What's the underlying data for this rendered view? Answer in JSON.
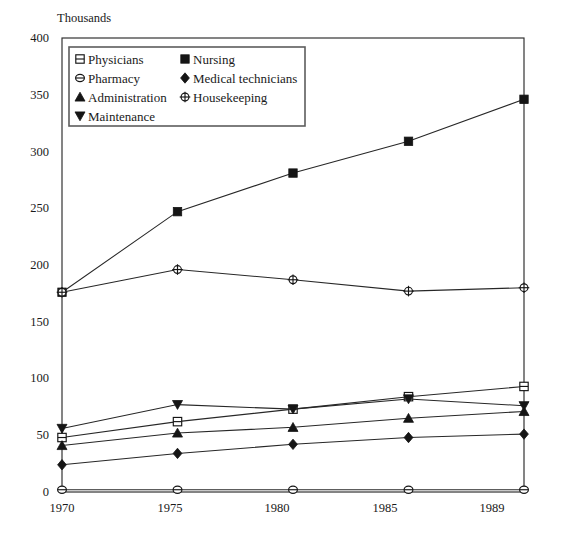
{
  "chart_data": {
    "type": "line",
    "title": "",
    "subtitle": "",
    "unit_label": "Thousands",
    "xlabel": "",
    "ylabel": "",
    "x": [
      "1970",
      "1975",
      "1980",
      "1985",
      "1989"
    ],
    "categories": [
      "1970",
      "1975",
      "1980",
      "1985",
      "1989"
    ],
    "xlim": [
      0,
      4
    ],
    "ylim": [
      0,
      400
    ],
    "y_ticks": [
      0,
      50,
      100,
      150,
      200,
      250,
      300,
      350,
      400
    ],
    "y_tick_labels": [
      "0",
      "50",
      "100",
      "150",
      "200",
      "250",
      "300",
      "350",
      "400"
    ],
    "grid": false,
    "legend_position": "top-left-inside",
    "series": [
      {
        "name": "Physicians",
        "marker": "square-open-bar",
        "values": [
          48,
          62,
          73,
          84,
          93
        ]
      },
      {
        "name": "Nursing",
        "marker": "square-filled",
        "values": [
          176,
          247,
          281,
          309,
          346
        ]
      },
      {
        "name": "Pharmacy",
        "marker": "circle-open-bar",
        "values": [
          2,
          2,
          2,
          2,
          2
        ]
      },
      {
        "name": "Medical technicians",
        "marker": "diamond-filled",
        "values": [
          24,
          34,
          42,
          48,
          51
        ]
      },
      {
        "name": "Administration",
        "marker": "triangle-up",
        "values": [
          41,
          52,
          57,
          65,
          71
        ]
      },
      {
        "name": "Housekeeping",
        "marker": "circle-open-cross",
        "values": [
          176,
          196,
          187,
          177,
          180
        ]
      },
      {
        "name": "Maintenance",
        "marker": "triangle-down",
        "values": [
          56,
          77,
          73,
          82,
          76
        ]
      }
    ],
    "annotations": []
  },
  "legend": {
    "entries": [
      {
        "label": "Physicians",
        "marker": "square-open-bar",
        "col": 0,
        "row": 0
      },
      {
        "label": "Nursing",
        "marker": "square-filled",
        "col": 1,
        "row": 0
      },
      {
        "label": "Pharmacy",
        "marker": "circle-open-bar",
        "col": 0,
        "row": 1
      },
      {
        "label": "Medical technicians",
        "marker": "diamond-filled",
        "col": 1,
        "row": 1
      },
      {
        "label": "Administration",
        "marker": "triangle-up",
        "col": 0,
        "row": 2
      },
      {
        "label": "Housekeeping",
        "marker": "circle-open-cross",
        "col": 1,
        "row": 2
      },
      {
        "label": "Maintenance",
        "marker": "triangle-down",
        "col": 0,
        "row": 3
      }
    ]
  },
  "colors": {
    "line": "#272727",
    "marker_fill": "#151515",
    "marker_open_fill": "#ffffff",
    "axis": "#2b2b2b",
    "text": "#1a1a1a",
    "background": "#ffffff",
    "legend_border": "#5d5d5d"
  },
  "labels": {
    "unit": "Thousands",
    "y0": "0",
    "y50": "50",
    "y100": "100",
    "y150": "150",
    "y200": "200",
    "y250": "250",
    "y300": "300",
    "y350": "350",
    "y400": "400",
    "x0": "1970",
    "x1": "1975",
    "x2": "1980",
    "x3": "1985",
    "x4": "1989"
  }
}
